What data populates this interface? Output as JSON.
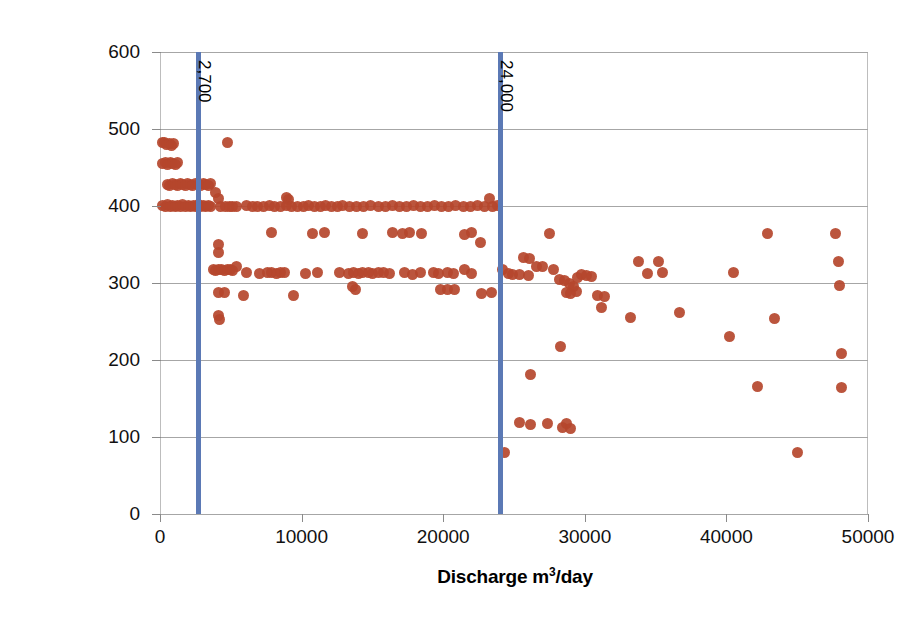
{
  "chart_data": {
    "type": "scatter",
    "title": "",
    "xlabel": "Discharge m³/day",
    "ylabel": "Electrical Conductivity µS/cm",
    "xlim": [
      0,
      50000
    ],
    "ylim": [
      0,
      600
    ],
    "xticks": [
      0,
      10000,
      20000,
      30000,
      40000,
      50000
    ],
    "yticks": [
      0,
      100,
      200,
      300,
      400,
      500,
      600
    ],
    "xticklabels": [
      "0",
      "10000",
      "20000",
      "30000",
      "40000",
      "50000"
    ],
    "yticklabels": [
      "0",
      "100",
      "200",
      "300",
      "400",
      "500",
      "600"
    ],
    "grid": "horizontal",
    "legend": "none",
    "marker_color": "#b5462d",
    "gridline_color": "#a6a6a6",
    "annotation_line_color": "#5b79b5",
    "annotations": [
      {
        "label": "2,700",
        "x": 2700,
        "orientation": "vertical-line"
      },
      {
        "label": "24,000",
        "x": 24000,
        "orientation": "vertical-line"
      }
    ],
    "series": [
      {
        "name": "Electrical Conductivity vs Discharge",
        "points": [
          [
            150,
            482
          ],
          [
            320,
            482
          ],
          [
            480,
            480
          ],
          [
            640,
            481
          ],
          [
            800,
            479
          ],
          [
            980,
            481
          ],
          [
            200,
            455
          ],
          [
            380,
            456
          ],
          [
            560,
            454
          ],
          [
            740,
            456
          ],
          [
            900,
            455
          ],
          [
            1080,
            454
          ],
          [
            1250,
            456
          ],
          [
            520,
            428
          ],
          [
            700,
            427
          ],
          [
            880,
            429
          ],
          [
            1060,
            428
          ],
          [
            1240,
            427
          ],
          [
            1420,
            429
          ],
          [
            1600,
            428
          ],
          [
            1780,
            427
          ],
          [
            1960,
            429
          ],
          [
            2140,
            428
          ],
          [
            2320,
            427
          ],
          [
            2500,
            429
          ],
          [
            2700,
            428
          ],
          [
            2880,
            427
          ],
          [
            3060,
            429
          ],
          [
            3240,
            428
          ],
          [
            3420,
            427
          ],
          [
            3600,
            429
          ],
          [
            180,
            401
          ],
          [
            360,
            400
          ],
          [
            540,
            402
          ],
          [
            720,
            400
          ],
          [
            900,
            401
          ],
          [
            1080,
            399
          ],
          [
            1260,
            401
          ],
          [
            1440,
            400
          ],
          [
            1620,
            402
          ],
          [
            1800,
            400
          ],
          [
            1980,
            401
          ],
          [
            2160,
            399
          ],
          [
            2340,
            401
          ],
          [
            2520,
            400
          ],
          [
            2700,
            402
          ],
          [
            2880,
            400
          ],
          [
            3060,
            401
          ],
          [
            3240,
            399
          ],
          [
            3420,
            401
          ],
          [
            3600,
            400
          ],
          [
            3900,
            418
          ],
          [
            4100,
            410
          ],
          [
            4300,
            399
          ],
          [
            4600,
            400
          ],
          [
            4900,
            399
          ],
          [
            5100,
            400
          ],
          [
            5400,
            399
          ],
          [
            4800,
            483
          ],
          [
            4100,
            350
          ],
          [
            4150,
            340
          ],
          [
            3750,
            317
          ],
          [
            3950,
            316
          ],
          [
            4150,
            318
          ],
          [
            4350,
            317
          ],
          [
            4550,
            316
          ],
          [
            4750,
            318
          ],
          [
            4950,
            317
          ],
          [
            5150,
            316
          ],
          [
            5400,
            322
          ],
          [
            4100,
            288
          ],
          [
            4550,
            288
          ],
          [
            4150,
            258
          ],
          [
            4200,
            252
          ],
          [
            6100,
            401
          ],
          [
            6500,
            399
          ],
          [
            6900,
            400
          ],
          [
            7300,
            399
          ],
          [
            7700,
            401
          ],
          [
            8100,
            400
          ],
          [
            8500,
            399
          ],
          [
            8900,
            401
          ],
          [
            8950,
            411
          ],
          [
            9100,
            409
          ],
          [
            9300,
            400
          ],
          [
            9700,
            399
          ],
          [
            10100,
            400
          ],
          [
            10500,
            401
          ],
          [
            10900,
            399
          ],
          [
            11300,
            400
          ],
          [
            11700,
            401
          ],
          [
            12100,
            399
          ],
          [
            12500,
            400
          ],
          [
            12900,
            401
          ],
          [
            13400,
            400
          ],
          [
            13900,
            399
          ],
          [
            14400,
            400
          ],
          [
            14900,
            401
          ],
          [
            15400,
            399
          ],
          [
            15900,
            400
          ],
          [
            16400,
            401
          ],
          [
            16900,
            399
          ],
          [
            17400,
            400
          ],
          [
            17900,
            401
          ],
          [
            18400,
            399
          ],
          [
            18900,
            400
          ],
          [
            19400,
            401
          ],
          [
            19900,
            399
          ],
          [
            20400,
            400
          ],
          [
            20900,
            401
          ],
          [
            21400,
            399
          ],
          [
            21900,
            400
          ],
          [
            22400,
            401
          ],
          [
            22900,
            399
          ],
          [
            23300,
            410
          ],
          [
            23500,
            400
          ],
          [
            23800,
            401
          ],
          [
            7900,
            365
          ],
          [
            10800,
            364
          ],
          [
            11600,
            366
          ],
          [
            14300,
            364
          ],
          [
            16400,
            366
          ],
          [
            17100,
            364
          ],
          [
            17600,
            366
          ],
          [
            18500,
            364
          ],
          [
            21500,
            363
          ],
          [
            22000,
            365
          ],
          [
            22600,
            352
          ],
          [
            6100,
            313
          ],
          [
            7000,
            312
          ],
          [
            7600,
            314
          ],
          [
            7900,
            313
          ],
          [
            8200,
            312
          ],
          [
            8500,
            314
          ],
          [
            8800,
            313
          ],
          [
            10300,
            312
          ],
          [
            11100,
            314
          ],
          [
            12700,
            313
          ],
          [
            13300,
            312
          ],
          [
            13700,
            314
          ],
          [
            14000,
            312
          ],
          [
            14300,
            314
          ],
          [
            14700,
            313
          ],
          [
            15000,
            312
          ],
          [
            15400,
            314
          ],
          [
            15800,
            313
          ],
          [
            16200,
            312
          ],
          [
            17300,
            313
          ],
          [
            17800,
            311
          ],
          [
            18400,
            313
          ],
          [
            19300,
            314
          ],
          [
            19700,
            312
          ],
          [
            20300,
            313
          ],
          [
            20700,
            312
          ],
          [
            21500,
            318
          ],
          [
            22000,
            312
          ],
          [
            13600,
            296
          ],
          [
            13800,
            291
          ],
          [
            19800,
            291
          ],
          [
            20300,
            292
          ],
          [
            20800,
            291
          ],
          [
            5900,
            284
          ],
          [
            9400,
            284
          ],
          [
            22700,
            286
          ],
          [
            23400,
            288
          ],
          [
            24200,
            318
          ],
          [
            24600,
            312
          ],
          [
            24900,
            311
          ],
          [
            25700,
            333
          ],
          [
            26100,
            332
          ],
          [
            26600,
            322
          ],
          [
            27000,
            322
          ],
          [
            25400,
            311
          ],
          [
            26000,
            310
          ],
          [
            27500,
            364
          ],
          [
            27800,
            317
          ],
          [
            28200,
            305
          ],
          [
            28600,
            303
          ],
          [
            28900,
            299
          ],
          [
            29200,
            296
          ],
          [
            29500,
            307
          ],
          [
            29800,
            311
          ],
          [
            30100,
            310
          ],
          [
            30500,
            308
          ],
          [
            30900,
            284
          ],
          [
            31200,
            268
          ],
          [
            31400,
            282
          ],
          [
            28700,
            288
          ],
          [
            29000,
            287
          ],
          [
            29400,
            289
          ],
          [
            28300,
            218
          ],
          [
            26200,
            181
          ],
          [
            25400,
            119
          ],
          [
            26200,
            116
          ],
          [
            27400,
            118
          ],
          [
            28400,
            112
          ],
          [
            28700,
            117
          ],
          [
            29000,
            111
          ],
          [
            24300,
            80
          ],
          [
            33800,
            328
          ],
          [
            35200,
            328
          ],
          [
            34400,
            312
          ],
          [
            35500,
            313
          ],
          [
            33200,
            255
          ],
          [
            36700,
            262
          ],
          [
            40500,
            314
          ],
          [
            40200,
            231
          ],
          [
            42900,
            364
          ],
          [
            43400,
            254
          ],
          [
            42200,
            165
          ],
          [
            45000,
            80
          ],
          [
            47700,
            364
          ],
          [
            47900,
            328
          ],
          [
            48000,
            297
          ],
          [
            48100,
            209
          ],
          [
            48100,
            164
          ]
        ]
      }
    ]
  },
  "axis": {
    "y_title": "Electrical Conductivity µS/cm",
    "x_title_prefix": "Discharge m",
    "x_title_sup": "3",
    "x_title_suffix": "/day"
  }
}
